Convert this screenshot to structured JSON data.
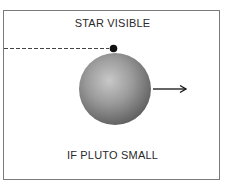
{
  "diagram": {
    "title": "STAR VISIBLE",
    "caption": "IF PLUTO SMALL",
    "elements": {
      "star": {
        "shape": "dot",
        "color": "#111111"
      },
      "planet": {
        "shape": "shaded-sphere",
        "color": "#8a8a8a"
      },
      "line_of_sight": {
        "style": "dashed"
      },
      "motion_arrow": {
        "direction": "right"
      }
    }
  }
}
